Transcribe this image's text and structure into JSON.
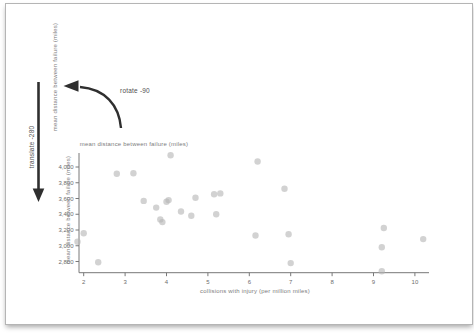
{
  "figure": {
    "annotations": {
      "rotate_label": "rotate -90",
      "translate_label": "translate -280",
      "ghost_vertical_label": "mean distance between failure (miles)",
      "ghost_horizontal_label": "mean distance between failure (miles)"
    },
    "colors": {
      "arrow": "#2f2f2f",
      "axis": "#787878",
      "tick_text": "#6e6e6e",
      "point": "#b4b4b4",
      "label": "#7d7d7d",
      "annotation": "#4f4f4f",
      "border": "#b5b5b5"
    }
  },
  "chart_data": {
    "type": "scatter",
    "title": "",
    "xlabel": "collisions with injury (per million miles)",
    "ylabel": "mean distance between failure (miles)",
    "x_ticks": [
      2,
      3,
      4,
      5,
      6,
      7,
      8,
      9,
      10
    ],
    "y_ticks": [
      2800,
      3000,
      3200,
      3400,
      3600,
      3800,
      4000
    ],
    "y_tick_labels": [
      "2,800",
      "3,000",
      "3,200",
      "3,400",
      "3,600",
      "3,800",
      "4,000"
    ],
    "xlim": [
      1.8,
      10.5
    ],
    "ylim": [
      2650,
      4200
    ],
    "grid": false,
    "legend": "none",
    "points": [
      [
        2.0,
        3160
      ],
      [
        1.85,
        3050
      ],
      [
        2.35,
        2790
      ],
      [
        2.8,
        3915
      ],
      [
        3.2,
        3920
      ],
      [
        3.45,
        3570
      ],
      [
        3.75,
        3485
      ],
      [
        3.85,
        3335
      ],
      [
        3.9,
        3300
      ],
      [
        4.0,
        3560
      ],
      [
        4.05,
        3580
      ],
      [
        4.1,
        4150
      ],
      [
        4.35,
        3435
      ],
      [
        4.6,
        3380
      ],
      [
        4.7,
        3610
      ],
      [
        5.15,
        3655
      ],
      [
        5.3,
        3665
      ],
      [
        5.2,
        3400
      ],
      [
        6.2,
        4070
      ],
      [
        6.15,
        3130
      ],
      [
        6.85,
        3725
      ],
      [
        6.95,
        3145
      ],
      [
        7.0,
        2780
      ],
      [
        9.25,
        3225
      ],
      [
        9.2,
        2980
      ],
      [
        9.2,
        2675
      ],
      [
        10.2,
        3085
      ]
    ]
  }
}
